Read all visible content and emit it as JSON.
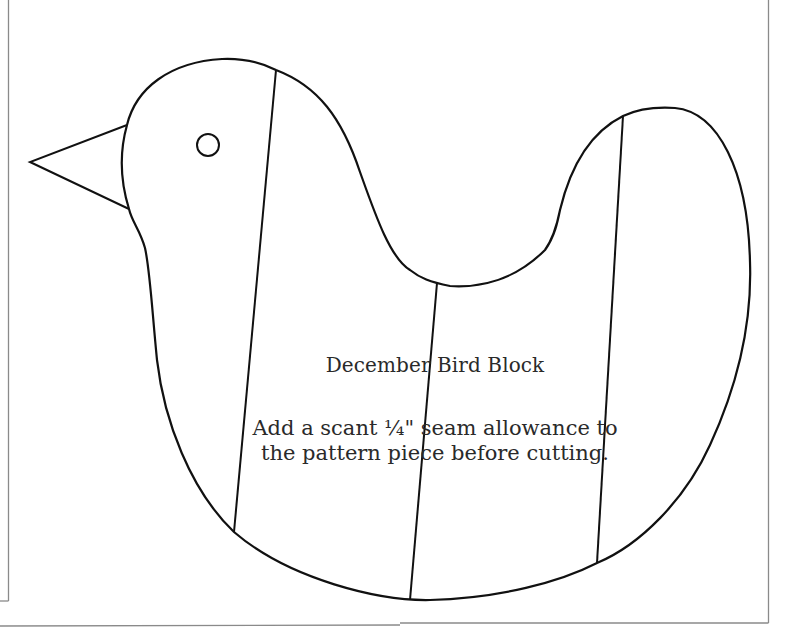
{
  "document": {
    "title": "December Bird Block",
    "instructions": {
      "line1": "Add a scant ¼\" seam allowance  to",
      "line2": "the pattern piece before cutting."
    }
  },
  "drawing": {
    "stroke_color": "#111111",
    "border_color": "#8a8a8a",
    "shapes": [
      "bird-outline",
      "beak",
      "eye",
      "seam-line-1",
      "seam-line-2",
      "seam-line-3",
      "page-border"
    ]
  }
}
